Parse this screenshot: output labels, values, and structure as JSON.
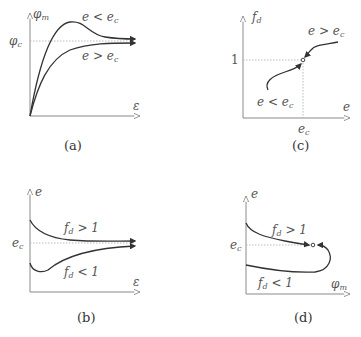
{
  "figure": {
    "panels": [
      {
        "id": "a",
        "caption": "(a)",
        "y_axis_label": "φ",
        "y_axis_sub": "m",
        "x_axis_label": "ε",
        "y_tick_label": "φ",
        "y_tick_sub": "c",
        "curves": [
          {
            "label_main": "e < e",
            "label_sub": "c",
            "shape": "rises to peak then decreases to φc"
          },
          {
            "label_main": "e > e",
            "label_sub": "c",
            "shape": "rises monotonically to φc"
          }
        ]
      },
      {
        "id": "c",
        "caption": "(c)",
        "y_axis_label": "f",
        "y_axis_sub": "d",
        "x_axis_label": "e",
        "y_tick_label": "1",
        "x_tick_label": "e",
        "x_tick_sub": "c",
        "curves": [
          {
            "label_main": "e < e",
            "label_sub": "c"
          },
          {
            "label_main": "e > e",
            "label_sub": "c"
          }
        ]
      },
      {
        "id": "b",
        "caption": "(b)",
        "y_axis_label": "e",
        "x_axis_label": "ε",
        "y_tick_label": "e",
        "y_tick_sub": "c",
        "curves": [
          {
            "label_main": "f",
            "label_sub": "d",
            "label_rel": " > 1",
            "shape": "decreases to ec"
          },
          {
            "label_main": "f",
            "label_sub": "d",
            "label_rel": " < 1",
            "shape": "dips then rises to ec"
          }
        ]
      },
      {
        "id": "d",
        "caption": "(d)",
        "y_axis_label": "e",
        "x_axis_label": "φ",
        "x_axis_sub": "m",
        "y_tick_label": "e",
        "y_tick_sub": "c",
        "curves": [
          {
            "label_main": "f",
            "label_sub": "d",
            "label_rel": " > 1"
          },
          {
            "label_main": "f",
            "label_sub": "d",
            "label_rel": " < 1"
          }
        ]
      }
    ]
  },
  "colors": {
    "curve": "#333333",
    "axis": "#8a8a8a",
    "guide": "#b5b5b5",
    "text": "#555555"
  }
}
